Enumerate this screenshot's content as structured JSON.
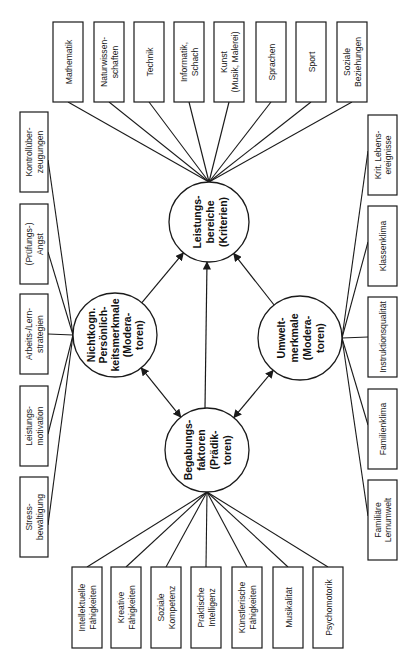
{
  "figure": {
    "orientation": "rotated-90-ccw",
    "colors": {
      "stroke": "#1a1a1a",
      "background": "#ffffff",
      "text": "#222222"
    }
  },
  "nodes": {
    "criteria": {
      "label": "Leistungsbereiche (Kriterien)",
      "lines": [
        "Leistungs-",
        "bereiche",
        "(Kriterien)"
      ]
    },
    "noncognitive": {
      "label": "Nichtkognitive Persönlichkeitsmerkmale (Moderatoren)",
      "lines": [
        "Nichtkogn.",
        "Persönlich-",
        "keitsmerkmale",
        "(Modera-",
        "toren)"
      ]
    },
    "environment": {
      "label": "Umweltmerkmale (Moderatoren)",
      "lines": [
        "Umwelt-",
        "merkmale",
        "(Modera-",
        "toren)"
      ]
    },
    "talent": {
      "label": "Begabungsfaktoren (Prädiktoren)",
      "lines": [
        "Begabungs-",
        "faktoren",
        "(Prädik-",
        "toren)"
      ]
    }
  },
  "criteria_boxes": [
    {
      "lines": [
        "Mathematik"
      ]
    },
    {
      "lines": [
        "Naturwissen-",
        "schaften"
      ]
    },
    {
      "lines": [
        "Technik"
      ]
    },
    {
      "lines": [
        "Informatik,",
        "Schach"
      ]
    },
    {
      "lines": [
        "Kunst",
        "(Musik, Malerei)"
      ]
    },
    {
      "lines": [
        "Sprachen"
      ]
    },
    {
      "lines": [
        "Sport"
      ]
    },
    {
      "lines": [
        "Soziale",
        "Beziehungen"
      ]
    }
  ],
  "noncognitive_boxes": [
    {
      "lines": [
        "Kontrollüber-",
        "zeugungen"
      ]
    },
    {
      "lines": [
        "(Prüfungs-)",
        "Angst"
      ]
    },
    {
      "lines": [
        "Arbeits-/Lern-",
        "strategien"
      ]
    },
    {
      "lines": [
        "Leistungs-",
        "motivation"
      ]
    },
    {
      "lines": [
        "Stress-",
        "bewältigung"
      ]
    }
  ],
  "environment_boxes": [
    {
      "lines": [
        "Krit. Lebens-",
        "ereignisse"
      ]
    },
    {
      "lines": [
        "Klassenklima"
      ]
    },
    {
      "lines": [
        "Instruktionsqualität"
      ]
    },
    {
      "lines": [
        "Familienklima"
      ]
    },
    {
      "lines": [
        "Familiäre",
        "Lernumwelt"
      ]
    }
  ],
  "talent_boxes": [
    {
      "lines": [
        "Intellektuelle",
        "Fähigkeiten"
      ]
    },
    {
      "lines": [
        "Kreative",
        "Fähigkeiten"
      ]
    },
    {
      "lines": [
        "Soziale",
        "Kompetenz"
      ]
    },
    {
      "lines": [
        "Praktische",
        "Intelligenz"
      ]
    },
    {
      "lines": [
        "Künstlerische",
        "Fähigkeiten"
      ]
    },
    {
      "lines": [
        "Musikalität"
      ]
    },
    {
      "lines": [
        "Psychomotorik"
      ]
    }
  ],
  "relations": [
    {
      "from": "noncognitive",
      "to": "criteria",
      "type": "arrow"
    },
    {
      "from": "environment",
      "to": "criteria",
      "type": "arrow"
    },
    {
      "from": "talent",
      "to": "criteria",
      "type": "arrow"
    },
    {
      "from": "talent",
      "to": "noncognitive",
      "type": "double-arrow"
    },
    {
      "from": "talent",
      "to": "environment",
      "type": "double-arrow"
    }
  ]
}
